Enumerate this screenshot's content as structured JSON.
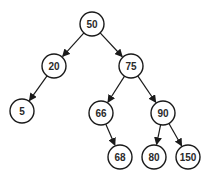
{
  "diagram": {
    "type": "binary-search-tree",
    "nodes": [
      {
        "id": "n50",
        "label": "50",
        "x": 92,
        "y": 24
      },
      {
        "id": "n20",
        "label": "20",
        "x": 54,
        "y": 66
      },
      {
        "id": "n75",
        "label": "75",
        "x": 131,
        "y": 66
      },
      {
        "id": "n5",
        "label": "5",
        "x": 22,
        "y": 111
      },
      {
        "id": "n66",
        "label": "66",
        "x": 101,
        "y": 113
      },
      {
        "id": "n90",
        "label": "90",
        "x": 163,
        "y": 113
      },
      {
        "id": "n68",
        "label": "68",
        "x": 120,
        "y": 157
      },
      {
        "id": "n80",
        "label": "80",
        "x": 154,
        "y": 157
      },
      {
        "id": "n150",
        "label": "150",
        "x": 188,
        "y": 157
      }
    ],
    "edges": [
      {
        "from": "n50",
        "to": "n20"
      },
      {
        "from": "n50",
        "to": "n75"
      },
      {
        "from": "n20",
        "to": "n5"
      },
      {
        "from": "n75",
        "to": "n66"
      },
      {
        "from": "n75",
        "to": "n90"
      },
      {
        "from": "n66",
        "to": "n68"
      },
      {
        "from": "n90",
        "to": "n80"
      },
      {
        "from": "n90",
        "to": "n150"
      }
    ],
    "node_radius": 12,
    "colors": {
      "stroke": "#1a1a1a",
      "fill": "#ffffff",
      "text": "#2a2a2a",
      "background": "#ffffff"
    }
  }
}
